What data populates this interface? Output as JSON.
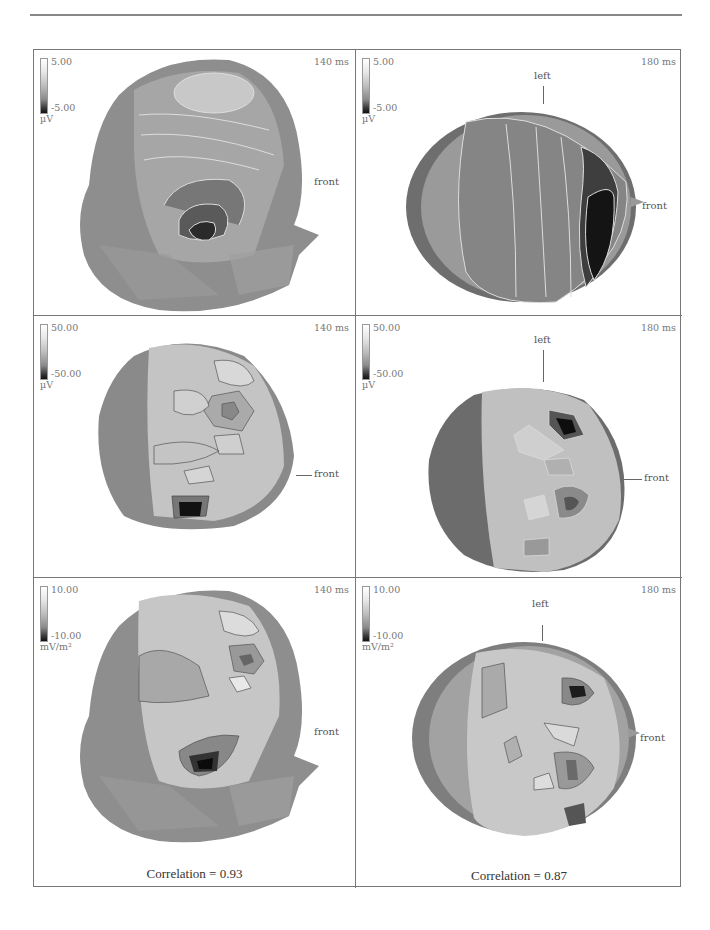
{
  "figure": {
    "columns": [
      "140 ms",
      "180 ms"
    ],
    "rows": [
      {
        "left": {
          "time": "140 ms",
          "scale_max": "5.00",
          "scale_min": "-5.00",
          "unit": "µV",
          "view": "side",
          "labels": {
            "front": "front"
          }
        },
        "right": {
          "time": "180 ms",
          "scale_max": "5.00",
          "scale_min": "-5.00",
          "unit": "µV",
          "view": "top",
          "labels": {
            "left": "left",
            "front": "front"
          }
        }
      },
      {
        "left": {
          "time": "140 ms",
          "scale_max": "50.00",
          "scale_min": "-50.00",
          "unit": "µV",
          "view": "side",
          "labels": {
            "front": "front"
          }
        },
        "right": {
          "time": "180 ms",
          "scale_max": "50.00",
          "scale_min": "-50.00",
          "unit": "µV",
          "view": "top",
          "labels": {
            "left": "left",
            "front": "front"
          }
        }
      },
      {
        "left": {
          "time": "140 ms",
          "scale_max": "10.00",
          "scale_min": "-10.00",
          "unit": "mV/m²",
          "view": "side",
          "labels": {
            "front": "front"
          }
        },
        "right": {
          "time": "180 ms",
          "scale_max": "10.00",
          "scale_min": "-10.00",
          "unit": "mV/m²",
          "view": "top",
          "labels": {
            "left": "left",
            "front": "front"
          }
        }
      }
    ],
    "captions": {
      "left": "Correlation = 0.93",
      "right": "Correlation = 0.87"
    }
  },
  "colors": {
    "border": "#777777",
    "head_dark": "#1a1a1a",
    "head_mid": "#8a8a8a",
    "head_light": "#d8d8d8"
  }
}
